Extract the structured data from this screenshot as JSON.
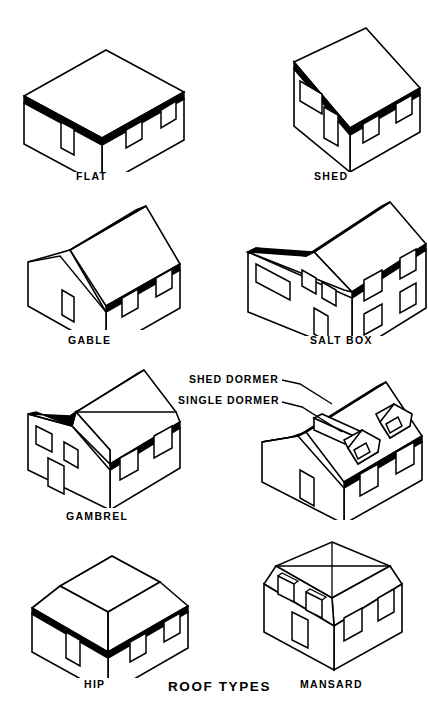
{
  "page": {
    "title": "ROOF TYPES",
    "background_color": "#ffffff",
    "ink_color": "#000000",
    "width": 428,
    "height": 715
  },
  "figures": [
    {
      "id": "flat",
      "label": "FLAT",
      "icon": "flat-roof-house-icon"
    },
    {
      "id": "shed",
      "label": "SHED",
      "icon": "shed-roof-house-icon"
    },
    {
      "id": "gable",
      "label": "GABLE",
      "icon": "gable-roof-house-icon"
    },
    {
      "id": "saltbox",
      "label": "SALT BOX",
      "icon": "salt-box-roof-house-icon"
    },
    {
      "id": "gambrel",
      "label": "GAMBREL",
      "icon": "gambrel-roof-house-icon"
    },
    {
      "id": "dormers",
      "label": "",
      "icon": "dormer-roof-house-icon"
    },
    {
      "id": "hip",
      "label": "HIP",
      "icon": "hip-roof-house-icon"
    },
    {
      "id": "mansard",
      "label": "MANSARD",
      "icon": "mansard-roof-house-icon"
    }
  ],
  "annotations": [
    {
      "id": "shed-dormer",
      "text": "SHED DORMER"
    },
    {
      "id": "single-dormer",
      "text": "SINGLE DORMER"
    }
  ]
}
